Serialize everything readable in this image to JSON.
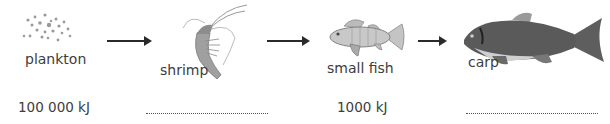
{
  "food_chain": {
    "organisms": [
      {
        "name": "plankton",
        "energy": "100 000 kJ"
      },
      {
        "name": "shrimp",
        "energy": ""
      },
      {
        "name": "small fish",
        "energy": "1000 kJ"
      },
      {
        "name": "carp",
        "energy": ""
      }
    ],
    "arrows": [
      {
        "from": "plankton",
        "to": "shrimp"
      },
      {
        "from": "shrimp",
        "to": "small fish"
      },
      {
        "from": "small fish",
        "to": "carp"
      }
    ],
    "blank_placeholder": "................................"
  }
}
